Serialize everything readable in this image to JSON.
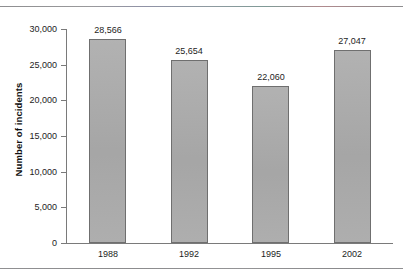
{
  "chart_data": {
    "type": "bar",
    "title": "",
    "subtitle": "",
    "xlabel": "",
    "ylabel": "Number of incidents",
    "categories": [
      "1988",
      "1992",
      "1995",
      "2002"
    ],
    "values": [
      28566,
      25654,
      22060,
      27047
    ],
    "value_labels": [
      "28,566",
      "25,654",
      "22,060",
      "27,047"
    ],
    "ytick_values": [
      0,
      5000,
      10000,
      15000,
      20000,
      25000,
      30000
    ],
    "ytick_labels": [
      "0",
      "5,000",
      "10,000",
      "15,000",
      "20,000",
      "25,000",
      "30,000"
    ],
    "ylim": [
      0,
      30000
    ],
    "grid": false,
    "legend": false,
    "legend_position": "none",
    "bar_fill_color": "#a9a9a9",
    "bar_border_color": "#6f6f6f",
    "axis_color": "#7a7a7a",
    "text_color": "#1d1d1d",
    "background_color": "#ffffff"
  },
  "axis": {
    "ytitle": "Number of incidents"
  },
  "ticks": {
    "y": [
      {
        "label": "30,000"
      },
      {
        "label": "25,000"
      },
      {
        "label": "20,000"
      },
      {
        "label": "15,000"
      },
      {
        "label": "10,000"
      },
      {
        "label": "5,000"
      },
      {
        "label": "0"
      }
    ]
  },
  "bars": [
    {
      "category": "1988",
      "value_label": "28,566"
    },
    {
      "category": "1992",
      "value_label": "25,654"
    },
    {
      "category": "1995",
      "value_label": "22,060"
    },
    {
      "category": "2002",
      "value_label": "27,047"
    }
  ]
}
